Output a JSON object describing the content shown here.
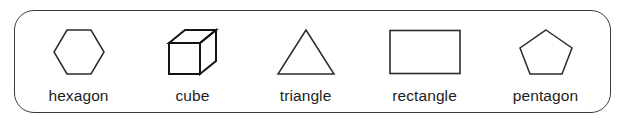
{
  "worksheet": {
    "title": "Shapes vocabulary strip",
    "border_color": "#3a3a3a",
    "ink_color": "#1d1d1d",
    "background_color": "#ffffff",
    "items": [
      {
        "id": "hexagon",
        "label": "hexagon",
        "icon_name": "hexagon-shape-icon",
        "sides": 6,
        "orientation": "flat-top"
      },
      {
        "id": "cube",
        "label": "cube",
        "icon_name": "cube-shape-icon",
        "faces": 6,
        "orientation": "oblique-projection"
      },
      {
        "id": "triangle",
        "label": "triangle",
        "icon_name": "triangle-shape-icon",
        "sides": 3,
        "orientation": "apex-up"
      },
      {
        "id": "rectangle",
        "label": "rectangle",
        "icon_name": "rectangle-shape-icon",
        "sides": 4,
        "orientation": "landscape"
      },
      {
        "id": "pentagon",
        "label": "pentagon",
        "icon_name": "pentagon-shape-icon",
        "sides": 5,
        "orientation": "point-up"
      }
    ]
  }
}
